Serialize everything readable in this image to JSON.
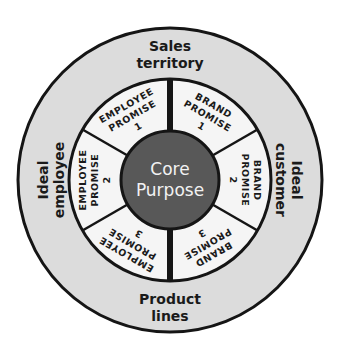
{
  "diagram": {
    "colors": {
      "background": "#ffffff",
      "outer_ring": "#dcdcdc",
      "middle_ring": "#f5f5f5",
      "core": "#585858",
      "stroke": "#151515",
      "core_text": "#f2f2f2"
    },
    "core": {
      "line1": "Core",
      "line2": "Purpose"
    },
    "outer": {
      "top": {
        "line1": "Sales",
        "line2": "territory"
      },
      "bottom": {
        "line1": "Product",
        "line2": "lines"
      },
      "left": {
        "line1": "Ideal",
        "line2": "employee"
      },
      "right": {
        "line1": "Ideal",
        "line2": "customer"
      }
    },
    "segments": [
      {
        "id": "brand-1",
        "line1": "BRAND",
        "line2": "PROMISE",
        "line3": "1"
      },
      {
        "id": "brand-2",
        "line1": "BRAND",
        "line2": "PROMISE",
        "line3": "2"
      },
      {
        "id": "brand-3",
        "line1": "BRAND",
        "line2": "PROMISE",
        "line3": "3"
      },
      {
        "id": "employee-3",
        "line1": "EMPLOYEE",
        "line2": "PROMISE",
        "line3": "3"
      },
      {
        "id": "employee-2",
        "line1": "EMPLOYEE",
        "line2": "PROMISE",
        "line3": "2"
      },
      {
        "id": "employee-1",
        "line1": "EMPLOYEE",
        "line2": "PROMISE",
        "line3": "1"
      }
    ]
  }
}
